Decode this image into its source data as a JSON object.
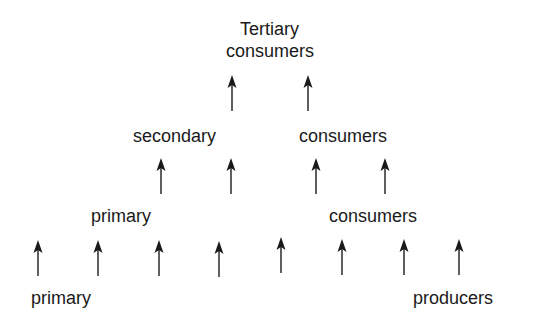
{
  "diagram": {
    "labels": {
      "tertiary_line1": "Tertiary",
      "tertiary_line2": "consumers",
      "secondary_left": "secondary",
      "secondary_right": "consumers",
      "primary_consumers_left": "primary",
      "primary_consumers_right": "consumers",
      "producers_left": "primary",
      "producers_right": "producers"
    },
    "arrow_rows": [
      {
        "name": "secondary-to-tertiary",
        "count": 2
      },
      {
        "name": "primary-to-secondary",
        "count": 4
      },
      {
        "name": "producers-to-primary",
        "count": 8
      }
    ]
  }
}
